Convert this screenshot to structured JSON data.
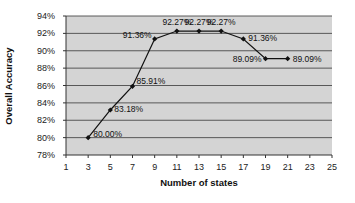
{
  "chart_data": {
    "type": "line",
    "title": "",
    "xlabel": "Number of states",
    "ylabel": "Overall Accuracy",
    "x": [
      3,
      5,
      7,
      9,
      11,
      13,
      15,
      17,
      19,
      21
    ],
    "series": [
      {
        "name": "Overall Accuracy",
        "values": [
          80.0,
          83.18,
          85.91,
          91.36,
          92.27,
          92.27,
          92.27,
          91.36,
          89.09,
          89.09
        ],
        "labels": [
          "80.00%",
          "83.18%",
          "85.91%",
          "91.36%",
          "92.27%",
          "92.27%",
          "92.27%",
          "91.36%",
          "89.09%",
          "89.09%"
        ]
      }
    ],
    "xlim": [
      1,
      25
    ],
    "ylim": [
      78,
      94
    ],
    "x_ticks": [
      "1",
      "3",
      "5",
      "7",
      "9",
      "11",
      "13",
      "15",
      "17",
      "19",
      "21",
      "23",
      "25"
    ],
    "y_ticks": [
      "78%",
      "80%",
      "82%",
      "84%",
      "86%",
      "88%",
      "90%",
      "92%",
      "94%"
    ],
    "grid": "horizontal",
    "legend": "none",
    "colors": {
      "plot_bg": "#d4d4d4",
      "line": "#111111",
      "grid": "#4a4a4a"
    }
  }
}
